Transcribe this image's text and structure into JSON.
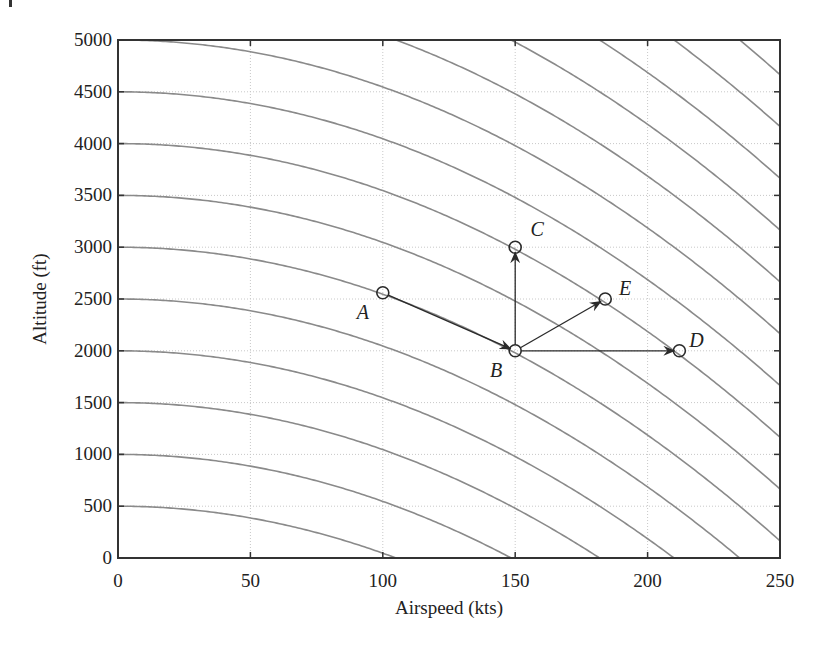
{
  "chart_data": {
    "type": "line",
    "title": "",
    "xlabel": "Airspeed (kts)",
    "ylabel": "Altitude (ft)",
    "xlim": [
      0,
      250
    ],
    "ylim": [
      0,
      5000
    ],
    "grid": true,
    "legend": null,
    "x_ticks": [
      0,
      50,
      100,
      150,
      200,
      250
    ],
    "y_ticks": [
      0,
      500,
      1000,
      1500,
      2000,
      2500,
      3000,
      3500,
      4000,
      4500,
      5000
    ],
    "x_tick_labels": [
      "0",
      "50",
      "100",
      "150",
      "200",
      "250"
    ],
    "y_tick_labels": [
      "0",
      "500",
      "1000",
      "1500",
      "2000",
      "2500",
      "3000",
      "3500",
      "4000",
      "4500",
      "5000"
    ],
    "curves": {
      "description": "Constant total-energy contours: altitude + k * airspeed^2",
      "k": 0.04535,
      "energy_levels_ft": [
        500,
        1000,
        1500,
        2000,
        2500,
        3000,
        3500,
        4000,
        4500,
        5000,
        5500,
        6000,
        6500,
        7000,
        7500,
        8000
      ]
    },
    "points": [
      {
        "name": "A",
        "x": 100,
        "y": 2560
      },
      {
        "name": "B",
        "x": 150,
        "y": 2000
      },
      {
        "name": "C",
        "x": 150,
        "y": 3000
      },
      {
        "name": "D",
        "x": 212,
        "y": 2000
      },
      {
        "name": "E",
        "x": 184,
        "y": 2500
      }
    ],
    "arrows": [
      {
        "from": "A",
        "to": "B"
      },
      {
        "from": "B",
        "to": "C"
      },
      {
        "from": "B",
        "to": "E"
      },
      {
        "from": "B",
        "to": "D"
      }
    ],
    "label_offsets": {
      "A": [
        -20,
        26
      ],
      "B": [
        -19,
        26
      ],
      "C": [
        22,
        -11
      ],
      "D": [
        17,
        -4
      ],
      "E": [
        20,
        -4
      ]
    }
  },
  "colors": {
    "curve": "#8a8a8a",
    "axis": "#333333",
    "grid": "#c8c8c8",
    "arrow": "#2a2a2a"
  }
}
